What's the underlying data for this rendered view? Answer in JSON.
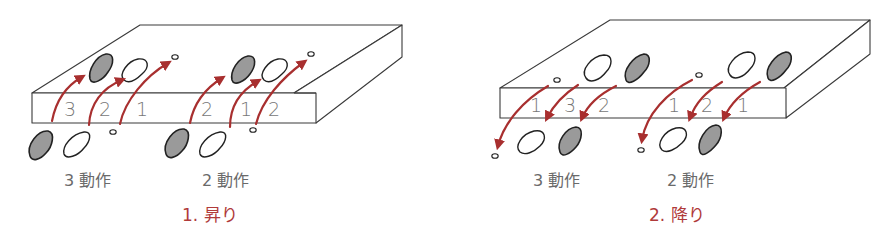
{
  "figure": {
    "colors": {
      "arrow": "#a82f2f",
      "caption": "#b03a3a",
      "label": "#6a6a6a",
      "foot_shaded": "#9a9a9a"
    },
    "panels": [
      {
        "id": "ascend",
        "caption": "1.  昇り",
        "groups": [
          {
            "label": "3 動作",
            "step_numbers": [
              "3",
              "2",
              "1"
            ]
          },
          {
            "label": "2 動作",
            "step_numbers": [
              "2",
              "1",
              "2"
            ]
          }
        ]
      },
      {
        "id": "descend",
        "caption": "2.  降り",
        "groups": [
          {
            "label": "3 動作",
            "step_numbers": [
              "1",
              "3",
              "2"
            ]
          },
          {
            "label": "2 動作",
            "step_numbers": [
              "1",
              "2",
              "1"
            ]
          }
        ]
      }
    ]
  }
}
